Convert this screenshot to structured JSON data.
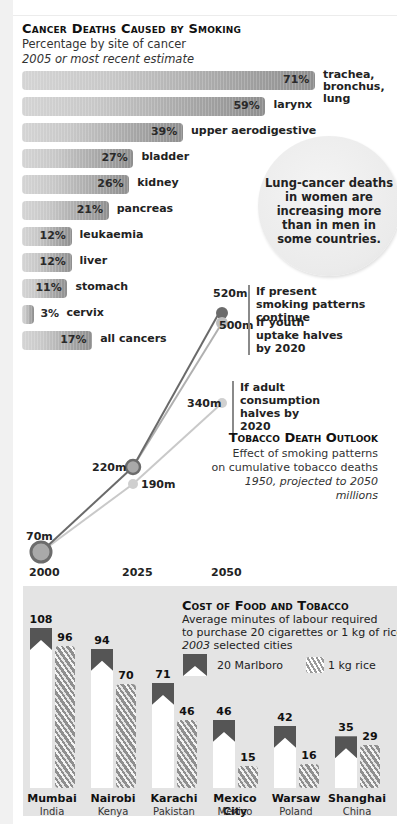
{
  "cancer": {
    "title": "Cancer Deaths Caused by Smoking",
    "subtitle": "Percentage by site of cancer",
    "note": "2005 or most recent estimate",
    "bars": [
      {
        "pct": "71%",
        "label_lines": [
          "trachea,",
          "bronchus,",
          "lung"
        ]
      },
      {
        "pct": "59%",
        "label_lines": [
          "larynx"
        ]
      },
      {
        "pct": "39%",
        "label_lines": [
          "upper aerodigestive"
        ]
      },
      {
        "pct": "27%",
        "label_lines": [
          "bladder"
        ]
      },
      {
        "pct": "26%",
        "label_lines": [
          "kidney"
        ]
      },
      {
        "pct": "21%",
        "label_lines": [
          "pancreas"
        ]
      },
      {
        "pct": "12%",
        "label_lines": [
          "leukaemia"
        ]
      },
      {
        "pct": "12%",
        "label_lines": [
          "liver"
        ]
      },
      {
        "pct": "11%",
        "label_lines": [
          "stomach"
        ]
      },
      {
        "pct": "3%",
        "label_lines": [
          "cervix"
        ]
      },
      {
        "pct": "17%",
        "label_lines": [
          "all cancers"
        ]
      }
    ],
    "callout": "Lung-cancer deaths in women are increasing more than in men in some countries."
  },
  "outlook": {
    "title": "Tobacco Death Outlook",
    "sub1": "Effect of smoking patterns",
    "sub2": "on cumulative tobacco deaths",
    "sub3": "1950, projected to 2050",
    "sub4": "millions",
    "years": [
      "2000",
      "2025",
      "2050"
    ],
    "labels": {
      "p2000": "70m",
      "p2025a": "220m",
      "p2025b": "190m",
      "p2050a": "520m",
      "p2050b": "500m",
      "p2050c": "340m"
    },
    "scenarios": {
      "a": "If present smoking patterns continue",
      "b": "If youth uptake halves by 2020",
      "c": "If adult consumption halves by 2020"
    }
  },
  "food": {
    "title": "Cost of Food and Tobacco",
    "sub1": "Average minutes of labour required",
    "sub2": "to purchase 20 cigarettes or 1 kg of rice",
    "sub3_year": "2003",
    "sub3_rest": " selected cities",
    "legend_marlboro": "20 Marlboro",
    "legend_rice": "1 kg rice",
    "cities": [
      {
        "city": "Mumbai",
        "country": "India",
        "marlboro": "108",
        "rice": "96"
      },
      {
        "city": "Nairobi",
        "country": "Kenya",
        "marlboro": "94",
        "rice": "70"
      },
      {
        "city": "Karachi",
        "country": "Pakistan",
        "marlboro": "71",
        "rice": "46"
      },
      {
        "city": "Mexico City",
        "country": "Mexico",
        "marlboro": "46",
        "rice": "15"
      },
      {
        "city": "Warsaw",
        "country": "Poland",
        "marlboro": "42",
        "rice": "16"
      },
      {
        "city": "Shanghai",
        "country": "China",
        "marlboro": "35",
        "rice": "29"
      }
    ]
  },
  "chart_data": [
    {
      "type": "bar",
      "title": "Cancer Deaths Caused by Smoking",
      "subtitle": "Percentage by site of cancer, 2005 or most recent estimate",
      "orientation": "horizontal",
      "categories": [
        "trachea, bronchus, lung",
        "larynx",
        "upper aerodigestive",
        "bladder",
        "kidney",
        "pancreas",
        "leukaemia",
        "liver",
        "stomach",
        "cervix",
        "all cancers"
      ],
      "values": [
        71,
        59,
        39,
        27,
        26,
        21,
        12,
        12,
        11,
        3,
        17
      ],
      "xlabel": "",
      "ylabel": "%",
      "grid": false
    },
    {
      "type": "line",
      "title": "Tobacco Death Outlook",
      "subtitle": "Effect of smoking patterns on cumulative tobacco deaths, 1950, projected to 2050, millions",
      "x": [
        2000,
        2025,
        2050
      ],
      "series": [
        {
          "name": "If present smoking patterns continue",
          "values": [
            70,
            220,
            520
          ]
        },
        {
          "name": "If youth uptake halves by 2020",
          "values": [
            70,
            220,
            500
          ]
        },
        {
          "name": "If adult consumption halves by 2020",
          "values": [
            70,
            190,
            340
          ]
        }
      ],
      "ylabel": "millions",
      "grid": false
    },
    {
      "type": "bar",
      "title": "Cost of Food and Tobacco",
      "subtitle": "Average minutes of labour required to purchase 20 cigarettes or 1 kg of rice, 2003 selected cities",
      "categories": [
        "Mumbai, India",
        "Nairobi, Kenya",
        "Karachi, Pakistan",
        "Mexico City, Mexico",
        "Warsaw, Poland",
        "Shanghai, China"
      ],
      "series": [
        {
          "name": "20 Marlboro",
          "values": [
            108,
            94,
            71,
            46,
            42,
            35
          ]
        },
        {
          "name": "1 kg rice",
          "values": [
            96,
            70,
            46,
            15,
            16,
            29
          ]
        }
      ],
      "ylabel": "minutes",
      "legend_position": "top-right",
      "grid": false
    }
  ]
}
